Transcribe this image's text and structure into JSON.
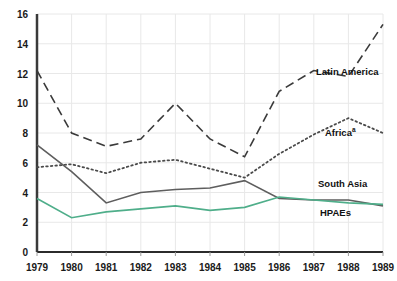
{
  "chart_data": {
    "type": "line",
    "title": "",
    "xlabel": "",
    "ylabel": "",
    "categories": [
      "1979",
      "1980",
      "1981",
      "1982",
      "1983",
      "1984",
      "1985",
      "1986",
      "1987",
      "1988",
      "1989"
    ],
    "x": [
      1979,
      1980,
      1981,
      1982,
      1983,
      1984,
      1985,
      1986,
      1987,
      1988,
      1989
    ],
    "xlim": [
      1979,
      1989
    ],
    "ylim": [
      0,
      16
    ],
    "yticks": [
      0,
      2,
      4,
      6,
      8,
      10,
      12,
      14,
      16
    ],
    "grid": true,
    "legend_position": "inline-right-of-series",
    "series": [
      {
        "name": "Latin America",
        "style": "dashed",
        "color": "#3a3a3a",
        "values": [
          12.2,
          8.0,
          7.1,
          7.6,
          10.0,
          7.6,
          6.4,
          10.8,
          12.2,
          11.8,
          15.3
        ]
      },
      {
        "name": "Africa",
        "label_superscript": "a",
        "style": "dotted",
        "color": "#4a4a4a",
        "values": [
          5.7,
          5.9,
          5.3,
          6.0,
          6.2,
          5.6,
          5.0,
          6.6,
          7.9,
          9.0,
          8.0
        ]
      },
      {
        "name": "South Asia",
        "style": "solid",
        "color": "#5e5e5e",
        "values": [
          7.2,
          5.4,
          3.3,
          4.0,
          4.2,
          4.3,
          4.8,
          3.6,
          3.5,
          3.5,
          3.1
        ]
      },
      {
        "name": "HPAEs",
        "style": "solid",
        "color": "#4fae8a",
        "values": [
          3.6,
          2.3,
          2.7,
          2.9,
          3.1,
          2.8,
          3.0,
          3.7,
          3.5,
          3.3,
          3.2
        ]
      }
    ]
  },
  "axis": {
    "y_tick_labels": [
      "0",
      "2",
      "4",
      "6",
      "8",
      "10",
      "12",
      "14",
      "16"
    ],
    "x_tick_labels": [
      "1979",
      "1980",
      "1981",
      "1982",
      "1983",
      "1984",
      "1985",
      "1986",
      "1987",
      "1988",
      "1989"
    ]
  },
  "series_labels": [
    {
      "text": "Latin America",
      "sup": ""
    },
    {
      "text": "Africa",
      "sup": "a"
    },
    {
      "text": "South Asia",
      "sup": ""
    },
    {
      "text": "HPAEs",
      "sup": ""
    }
  ]
}
